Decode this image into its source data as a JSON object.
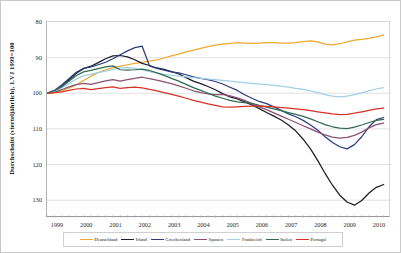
{
  "chart_data": {
    "type": "line",
    "title": "",
    "ylabel": "Durchschnitt (vierteljährlich), 1.VJ 1999=100",
    "xlabel": "",
    "grid": true,
    "y_inverted": true,
    "ylim": [
      80,
      135
    ],
    "yticks": [
      80,
      90,
      100,
      110,
      120,
      130
    ],
    "xticks": [
      "1999",
      "2000",
      "2001",
      "2002",
      "2003",
      "2004",
      "2005",
      "2006",
      "2007",
      "2008",
      "2009",
      "2010"
    ],
    "xlim": [
      1999,
      2010.75
    ],
    "legend_position": "bottom",
    "x": [
      1999.0,
      1999.25,
      1999.5,
      1999.75,
      2000.0,
      2000.25,
      2000.5,
      2000.75,
      2001.0,
      2001.25,
      2001.5,
      2001.75,
      2002.0,
      2002.25,
      2002.5,
      2002.75,
      2003.0,
      2003.25,
      2003.5,
      2003.75,
      2004.0,
      2004.25,
      2004.5,
      2004.75,
      2005.0,
      2005.25,
      2005.5,
      2005.75,
      2006.0,
      2006.25,
      2006.5,
      2006.75,
      2007.0,
      2007.25,
      2007.5,
      2007.75,
      2008.0,
      2008.25,
      2008.5,
      2008.75,
      2009.0,
      2009.25,
      2009.5,
      2009.75,
      2010.0,
      2010.25,
      2010.5
    ],
    "series": [
      {
        "name": "Deutschland",
        "color": "#F0A830",
        "values": [
          100.0,
          99.8,
          99.3,
          98.6,
          97.6,
          96.4,
          95.2,
          94.2,
          93.4,
          92.8,
          92.4,
          92.0,
          91.6,
          91.3,
          91.0,
          90.6,
          90.1,
          89.5,
          89.0,
          88.4,
          87.9,
          87.4,
          86.9,
          86.5,
          86.2,
          86.0,
          85.8,
          85.9,
          86.0,
          85.9,
          85.8,
          85.8,
          85.9,
          85.9,
          85.8,
          85.5,
          85.3,
          85.6,
          86.2,
          86.4,
          86.1,
          85.6,
          85.1,
          84.9,
          84.6,
          84.2,
          83.6
        ]
      },
      {
        "name": "Irland",
        "color": "#1C1C2E",
        "values": [
          100.0,
          99.5,
          98.1,
          96.3,
          94.4,
          93.1,
          92.4,
          91.4,
          90.3,
          89.5,
          89.4,
          89.8,
          90.6,
          91.6,
          92.2,
          92.9,
          93.3,
          93.9,
          94.6,
          95.6,
          96.6,
          97.3,
          98.1,
          99.0,
          100.1,
          101.0,
          101.6,
          102.4,
          103.3,
          104.3,
          105.4,
          106.4,
          107.5,
          108.9,
          110.6,
          112.9,
          115.6,
          118.9,
          122.5,
          125.8,
          128.6,
          130.5,
          131.4,
          130.1,
          128.0,
          126.4,
          125.6
        ]
      },
      {
        "name": "Griechenland",
        "color": "#2B3C7E",
        "values": [
          100.0,
          99.2,
          97.7,
          95.9,
          94.1,
          93.0,
          92.6,
          92.0,
          91.3,
          90.3,
          89.2,
          88.1,
          87.2,
          86.8,
          92.3,
          93.0,
          93.5,
          94.0,
          94.3,
          94.8,
          95.4,
          95.8,
          96.2,
          96.7,
          97.4,
          98.3,
          99.2,
          100.4,
          101.4,
          102.3,
          102.9,
          103.8,
          104.8,
          105.8,
          106.6,
          107.6,
          108.9,
          110.4,
          112.2,
          113.8,
          115.0,
          115.6,
          114.4,
          112.2,
          109.4,
          107.4,
          106.8
        ]
      },
      {
        "name": "Spanien",
        "color": "#8C5070",
        "values": [
          100.0,
          99.7,
          99.0,
          98.2,
          97.6,
          97.2,
          97.5,
          97.0,
          96.5,
          96.2,
          96.6,
          96.2,
          95.8,
          95.5,
          95.9,
          96.3,
          96.8,
          97.3,
          97.9,
          98.6,
          99.3,
          99.8,
          100.2,
          100.4,
          100.3,
          100.7,
          101.3,
          102.0,
          102.9,
          103.8,
          104.6,
          105.5,
          106.4,
          107.3,
          108.2,
          109.1,
          110.0,
          110.9,
          111.7,
          112.3,
          112.6,
          112.4,
          111.8,
          110.9,
          109.7,
          108.8,
          108.4
        ]
      },
      {
        "name": "Frankreich",
        "color": "#9FD0E8",
        "values": [
          100.0,
          99.4,
          98.5,
          97.3,
          96.0,
          95.1,
          94.6,
          94.2,
          93.8,
          93.3,
          92.9,
          92.8,
          93.0,
          93.4,
          93.9,
          94.3,
          94.7,
          95.0,
          95.2,
          95.4,
          95.6,
          95.8,
          96.0,
          96.2,
          96.4,
          96.6,
          96.8,
          97.0,
          97.2,
          97.4,
          97.6,
          97.8,
          98.0,
          98.3,
          98.6,
          98.9,
          99.3,
          99.8,
          100.4,
          100.8,
          101.0,
          100.8,
          100.4,
          99.9,
          99.3,
          98.8,
          98.4
        ]
      },
      {
        "name": "Italien",
        "color": "#2F6B4F",
        "values": [
          100.0,
          99.3,
          98.2,
          96.6,
          95.0,
          94.0,
          93.6,
          93.1,
          92.6,
          92.3,
          93.4,
          93.5,
          93.4,
          93.2,
          93.6,
          94.3,
          95.0,
          95.8,
          96.6,
          97.5,
          98.4,
          99.2,
          100.0,
          100.8,
          101.4,
          102.0,
          102.4,
          102.6,
          102.8,
          103.4,
          103.9,
          104.4,
          104.9,
          105.4,
          105.9,
          106.5,
          107.2,
          108.0,
          108.8,
          109.4,
          109.8,
          109.9,
          109.5,
          108.9,
          108.2,
          107.6,
          107.3
        ]
      },
      {
        "name": "Portugal",
        "color": "#D93226",
        "values": [
          100.0,
          99.8,
          99.6,
          99.2,
          98.8,
          98.6,
          99.0,
          98.7,
          98.4,
          98.2,
          98.6,
          98.4,
          98.3,
          98.5,
          98.9,
          99.3,
          99.8,
          100.3,
          100.8,
          101.4,
          102.0,
          102.5,
          103.0,
          103.4,
          103.8,
          103.9,
          103.8,
          103.7,
          103.6,
          103.6,
          103.7,
          103.8,
          104.0,
          104.2,
          104.4,
          104.6,
          104.9,
          105.2,
          105.5,
          105.8,
          106.0,
          105.9,
          105.6,
          105.2,
          104.8,
          104.4,
          104.2
        ]
      }
    ]
  },
  "legend": {
    "items": [
      {
        "label": "Deutschland"
      },
      {
        "label": "Irland"
      },
      {
        "label": "Griechenland"
      },
      {
        "label": "Spanien"
      },
      {
        "label": "Frankreich"
      },
      {
        "label": "Italien"
      },
      {
        "label": "Portugal"
      }
    ]
  }
}
